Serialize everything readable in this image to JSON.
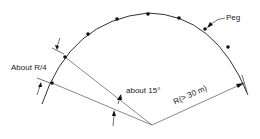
{
  "diagram": {
    "labels": {
      "peg": "Peg",
      "spacing": "About R/4",
      "angle": "about 15°",
      "radius": "R(> 30 m)"
    },
    "colors": {
      "line": "#333333",
      "peg": "#111111",
      "text": "#222222"
    }
  }
}
